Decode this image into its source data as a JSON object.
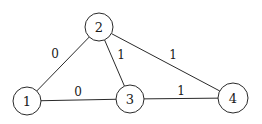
{
  "diagram": {
    "type": "weighted-undirected-graph",
    "nodes": [
      {
        "id": "1",
        "label": "1",
        "x": 27,
        "y": 101,
        "r": 14
      },
      {
        "id": "2",
        "label": "2",
        "x": 99,
        "y": 27,
        "r": 14
      },
      {
        "id": "3",
        "label": "3",
        "x": 130,
        "y": 99,
        "r": 14
      },
      {
        "id": "4",
        "label": "4",
        "x": 233,
        "y": 98,
        "r": 15
      }
    ],
    "edges": [
      {
        "from": "1",
        "to": "2",
        "weight": "0",
        "label_x": 55,
        "label_y": 54
      },
      {
        "from": "2",
        "to": "3",
        "weight": "1",
        "label_x": 121,
        "label_y": 55
      },
      {
        "from": "2",
        "to": "4",
        "weight": "1",
        "label_x": 173,
        "label_y": 55
      },
      {
        "from": "1",
        "to": "3",
        "weight": "0",
        "label_x": 78,
        "label_y": 92
      },
      {
        "from": "3",
        "to": "4",
        "weight": "1",
        "label_x": 181,
        "label_y": 91
      }
    ]
  }
}
